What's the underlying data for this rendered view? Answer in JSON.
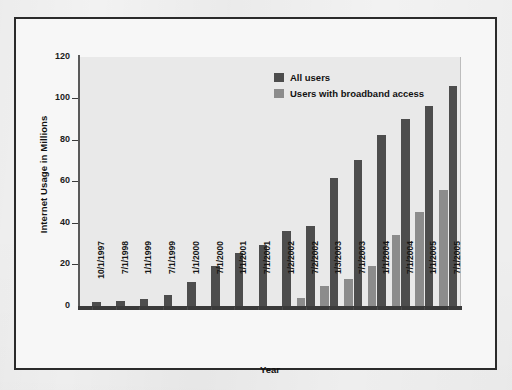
{
  "chart_data": {
    "type": "bar",
    "title": "",
    "xlabel": "Year",
    "ylabel": "Internet Usage in Millions",
    "ylim": [
      0,
      120
    ],
    "yticks": [
      0,
      20,
      40,
      60,
      80,
      100,
      120
    ],
    "grid": false,
    "legend_position": "top-right",
    "categories": [
      "10/1/1997",
      "7/1/1998",
      "1/1/1999",
      "7/1/1999",
      "1/1/2000",
      "7/1/2000",
      "1/1/2001",
      "7/1/2001",
      "1/2/2002",
      "7/2/2002",
      "1/3/2003",
      "7/1/2003",
      "1/1/2004",
      "7/1/2004",
      "1/1/2005",
      "7/1/2005"
    ],
    "series": [
      {
        "name": "All users",
        "color": "#4d4d4d",
        "values": [
          2,
          2.5,
          3.5,
          5.5,
          11.5,
          19.5,
          25.5,
          29.5,
          36,
          38.5,
          61.5,
          70.5,
          82.5,
          90,
          96.5,
          106
        ]
      },
      {
        "name": "Users with broadband access",
        "color": "#8c8c8c",
        "values": [
          0,
          0,
          0,
          0,
          0,
          0,
          0,
          0,
          0,
          3.8,
          9.5,
          13,
          19.5,
          34,
          45.5,
          56
        ]
      }
    ]
  },
  "legend": {
    "items": [
      {
        "label": "All users",
        "color": "#4d4d4d"
      },
      {
        "label": "Users with broadband access",
        "color": "#8c8c8c"
      }
    ]
  },
  "axes": {
    "y_title": "Internet Usage in Millions",
    "x_title": "Year",
    "y_tick_labels": [
      "120",
      "100",
      "80",
      "60",
      "40",
      "20",
      "0"
    ]
  }
}
